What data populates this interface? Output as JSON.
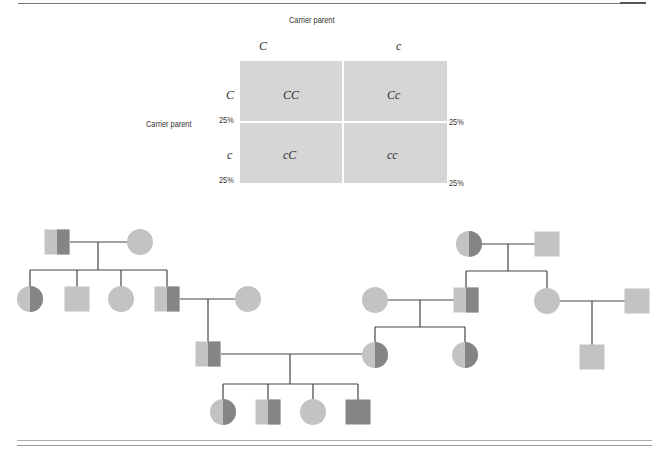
{
  "punnett": {
    "top_label": "Carrier parent",
    "side_label": "Carrier parent",
    "col_alleles": [
      "C",
      "c"
    ],
    "row_alleles": [
      "C",
      "c"
    ],
    "cells": [
      [
        "CC",
        "Cc"
      ],
      [
        "cC",
        "cc"
      ]
    ],
    "percent_labels": {
      "row1_left": "25%",
      "row1_right": "25%",
      "row2_left": "25%",
      "row2_right": "25%"
    },
    "cell_color": "#d6d6d6"
  },
  "pedigree": {
    "legend_colors": {
      "unaffected": "#c3c3c3",
      "carrier_dark_half": "#858585",
      "affected": "#858585",
      "line": "#444444"
    },
    "individuals": [
      {
        "id": "L1-father",
        "sex": "male",
        "status": "carrier"
      },
      {
        "id": "L1-mother",
        "sex": "female",
        "status": "unaffected"
      },
      {
        "id": "L2-daughter1",
        "sex": "female",
        "status": "carrier"
      },
      {
        "id": "L2-son1",
        "sex": "male",
        "status": "unaffected"
      },
      {
        "id": "L2-daughter2",
        "sex": "female",
        "status": "unaffected"
      },
      {
        "id": "L2-son2",
        "sex": "male",
        "status": "carrier"
      },
      {
        "id": "L2-son2-spouse",
        "sex": "female",
        "status": "unaffected"
      },
      {
        "id": "L3-son",
        "sex": "male",
        "status": "carrier"
      },
      {
        "id": "R1-mother",
        "sex": "female",
        "status": "carrier"
      },
      {
        "id": "R1-father",
        "sex": "male",
        "status": "unaffected"
      },
      {
        "id": "R2-son-spouse",
        "sex": "female",
        "status": "unaffected"
      },
      {
        "id": "R2-son",
        "sex": "male",
        "status": "carrier"
      },
      {
        "id": "R2-daughter",
        "sex": "female",
        "status": "unaffected"
      },
      {
        "id": "R2-daughter-spouse",
        "sex": "male",
        "status": "unaffected"
      },
      {
        "id": "R3-daughter1",
        "sex": "female",
        "status": "carrier"
      },
      {
        "id": "R3-daughter2",
        "sex": "female",
        "status": "carrier"
      },
      {
        "id": "R3-grandson",
        "sex": "male",
        "status": "unaffected"
      },
      {
        "id": "G4-daughter1",
        "sex": "female",
        "status": "carrier"
      },
      {
        "id": "G4-son1",
        "sex": "male",
        "status": "carrier"
      },
      {
        "id": "G4-daughter2",
        "sex": "female",
        "status": "unaffected"
      },
      {
        "id": "G4-son2",
        "sex": "male",
        "status": "affected"
      }
    ]
  }
}
